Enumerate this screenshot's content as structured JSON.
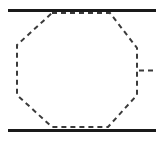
{
  "figure": {
    "canvas": {
      "width": 156,
      "height": 142,
      "background_color": "#ffffff"
    },
    "colors": {
      "solid_line": "#1a1a1a",
      "dashed_line": "#3b3b3b",
      "background": "#ffffff"
    },
    "elements": {
      "top_rail": {
        "label": "top rail",
        "kind": "solid-horizontal-line",
        "x1": 8,
        "y1": 10.5,
        "x2": 156,
        "y2": 10.5,
        "stroke_width": 3,
        "color": "#1a1a1a"
      },
      "bottom_rail": {
        "label": "bottom rail",
        "kind": "solid-horizontal-line",
        "x1": 8,
        "y1": 130.5,
        "x2": 156,
        "y2": 130.5,
        "stroke_width": 3,
        "color": "#1a1a1a"
      },
      "octagon": {
        "label": "octagon",
        "kind": "dashed-polygon",
        "sides": 8,
        "stroke_width": 2,
        "dash_length": 5,
        "gap_length": 4,
        "color": "#3b3b3b",
        "fill": "none",
        "points": "52,13 110,13 137,48 137,95 108,127 52,127 17,95 17,45"
      },
      "leader_tick": {
        "label": "leader tick",
        "kind": "dashed-horizontal-tick",
        "x1": 139,
        "y1": 70.5,
        "x2": 156,
        "y2": 70.5,
        "stroke_width": 2,
        "dash_length": 5,
        "gap_length": 4,
        "color": "#3b3b3b"
      }
    }
  }
}
